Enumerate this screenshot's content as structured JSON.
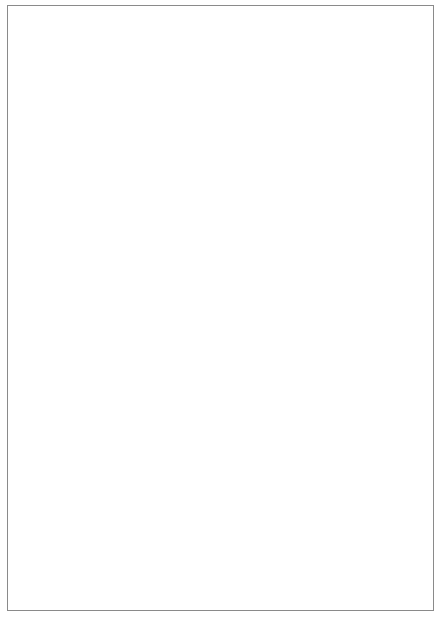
{
  "chart_data": {
    "type": "star",
    "title": "",
    "variables": [
      "REPAIR77",
      "REPAIR78",
      "MILEAGE",
      "PRICE",
      "GEAR RATIO",
      "DISPLACEMENT",
      "TURNCIRCLE",
      "LENGTH",
      "WEIGHT",
      "TRUNKSPACE",
      "REAR SEAT",
      "HEADROOM"
    ],
    "variable_angles_deg": [
      90,
      60,
      30,
      0,
      -30,
      -60,
      -90,
      -120,
      -150,
      180,
      150,
      120
    ],
    "value_scale": "each ray length normalized 0-1 (1 = maximum of variable)",
    "cars": [
      {
        "name": "BURI",
        "row": 0,
        "col": 0,
        "values": [
          0.85,
          0.85,
          0.8,
          0.9,
          0.75,
          0.75,
          0.85,
          0.85,
          0.85,
          0.85,
          0.85,
          0.85
        ]
      },
      {
        "name": "BUSK",
        "row": 0,
        "col": 1,
        "values": [
          0.75,
          0.75,
          0.7,
          0.7,
          0.65,
          0.7,
          0.75,
          0.75,
          0.7,
          0.7,
          0.7,
          0.7
        ]
      },
      {
        "name": "CADE",
        "row": 0,
        "col": 2,
        "values": [
          0.8,
          0.75,
          0.65,
          1.0,
          0.55,
          1.0,
          1.0,
          0.95,
          0.95,
          0.95,
          0.9,
          0.9
        ]
      },
      {
        "name": "CAEL",
        "row": 0,
        "col": 3,
        "values": [
          0.75,
          0.7,
          0.55,
          1.0,
          0.45,
          1.0,
          0.95,
          0.85,
          0.85,
          0.75,
          0.8,
          0.7
        ]
      },
      {
        "name": "CASE",
        "row": 0,
        "col": 4,
        "values": [
          0.75,
          0.7,
          0.55,
          1.0,
          0.5,
          0.95,
          0.95,
          0.85,
          0.85,
          0.6,
          0.8,
          0.8
        ]
      },
      {
        "name": "AUFO",
        "row": 1,
        "col": 0,
        "values": [
          0.55,
          0.45,
          0.6,
          0.6,
          0.65,
          0.95,
          0.6,
          0.55,
          0.55,
          0.55,
          0.55,
          0.45
        ]
      },
      {
        "name": "BM32",
        "row": 1,
        "col": 1,
        "values": [
          0.8,
          0.85,
          0.8,
          0.75,
          0.7,
          0.6,
          0.7,
          0.6,
          0.6,
          0.6,
          0.6,
          0.6
        ]
      },
      {
        "name": "BUCE",
        "row": 1,
        "col": 2,
        "values": [
          0.95,
          0.85,
          0.7,
          0.65,
          0.6,
          0.75,
          0.85,
          0.8,
          0.8,
          0.8,
          0.8,
          0.85
        ]
      },
      {
        "name": "BUEL",
        "row": 1,
        "col": 3,
        "values": [
          0.85,
          0.85,
          0.85,
          0.7,
          0.75,
          1.0,
          0.95,
          0.95,
          0.95,
          0.95,
          0.95,
          0.95
        ]
      },
      {
        "name": "BUSA",
        "row": 1,
        "col": 4,
        "values": [
          0.9,
          0.85,
          0.8,
          0.75,
          0.7,
          0.85,
          0.85,
          0.85,
          0.85,
          0.95,
          0.85,
          0.85
        ]
      },
      {
        "name": "BURE",
        "row": 1,
        "col": 5,
        "values": [
          0.65,
          0.55,
          0.6,
          0.6,
          0.6,
          0.6,
          0.65,
          0.6,
          0.6,
          0.65,
          0.6,
          0.35
        ]
      },
      {
        "name": "LICO",
        "row": 2,
        "col": 0,
        "values": [
          0.9,
          0.85,
          0.55,
          1.0,
          0.55,
          1.0,
          1.0,
          1.0,
          1.0,
          1.0,
          0.95,
          0.85
        ]
      },
      {
        "name": "LIMA",
        "row": 2,
        "col": 1,
        "values": [
          0.85,
          0.75,
          0.55,
          1.0,
          0.6,
          0.95,
          0.9,
          0.95,
          0.95,
          0.95,
          0.85,
          0.8
        ]
      },
      {
        "name": "LIVE",
        "row": 2,
        "col": 2,
        "values": [
          0.75,
          0.7,
          0.55,
          1.0,
          0.55,
          0.85,
          0.85,
          0.8,
          0.85,
          0.75,
          0.75,
          0.75
        ]
      },
      {
        "name": "AMCO",
        "row": 3,
        "col": 3,
        "values": [
          0.0,
          0.0,
          0.0,
          0.0,
          0.0,
          0.0,
          0.0,
          0.0,
          0.0,
          0.0,
          0.0,
          0.0
        ],
        "placeholder": true
      }
    ]
  },
  "grid": {
    "col_x": [
      43,
      116,
      188,
      262,
      336,
      406
    ],
    "row_y": [
      38,
      107,
      178,
      247,
      316,
      385
    ],
    "label_offset_y": 31,
    "max_radius": 22
  },
  "key": {
    "cx": 222,
    "cy": 519,
    "radius": 50,
    "spoke_length": 68
  },
  "frame_color": "#8a8a8a",
  "ink_color": "#1a1a1a"
}
